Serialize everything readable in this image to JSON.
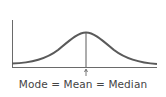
{
  "diagram": {
    "type": "normal-distribution",
    "label": "Mode = Mean = Median",
    "colors": {
      "curve": "#5a5a5a",
      "axis": "#6a6a6a",
      "text": "#444444",
      "background": "#ffffff"
    }
  }
}
